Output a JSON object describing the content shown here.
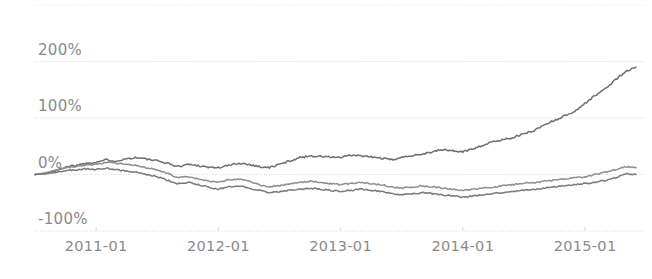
{
  "chart_data": {
    "type": "line",
    "title": "",
    "subtitle": "",
    "xlabel": "",
    "ylabel": "",
    "grid": true,
    "legend_position": "none",
    "xlim": [
      "2010-07",
      "2015-07"
    ],
    "ylim": [
      -100,
      300
    ],
    "ytick_labels": [
      "200%",
      "100%",
      "0%",
      "-100%"
    ],
    "ytick_values": [
      200,
      100,
      0,
      -100
    ],
    "xtick_labels": [
      "2011-01",
      "2012-01",
      "2013-01",
      "2014-01",
      "2015-01"
    ],
    "x": [
      "2010-07",
      "2010-08",
      "2010-09",
      "2010-10",
      "2010-11",
      "2010-12",
      "2011-01",
      "2011-02",
      "2011-03",
      "2011-04",
      "2011-05",
      "2011-06",
      "2011-07",
      "2011-08",
      "2011-09",
      "2011-10",
      "2011-11",
      "2011-12",
      "2012-01",
      "2012-02",
      "2012-03",
      "2012-04",
      "2012-05",
      "2012-06",
      "2012-07",
      "2012-08",
      "2012-09",
      "2012-10",
      "2012-11",
      "2012-12",
      "2013-01",
      "2013-02",
      "2013-03",
      "2013-04",
      "2013-05",
      "2013-06",
      "2013-07",
      "2013-08",
      "2013-09",
      "2013-10",
      "2013-11",
      "2013-12",
      "2014-01",
      "2014-02",
      "2014-03",
      "2014-04",
      "2014-05",
      "2014-06",
      "2014-07",
      "2014-08",
      "2014-09",
      "2014-10",
      "2014-11",
      "2014-12",
      "2015-01",
      "2015-02",
      "2015-03",
      "2015-04",
      "2015-05",
      "2015-06"
    ],
    "series": [
      {
        "name": "series-1",
        "color": "#6e6e6e",
        "values": [
          0,
          2,
          6,
          14,
          16,
          20,
          22,
          26,
          24,
          28,
          30,
          27,
          24,
          20,
          14,
          18,
          16,
          13,
          12,
          16,
          20,
          18,
          14,
          12,
          18,
          24,
          30,
          33,
          32,
          31,
          30,
          34,
          33,
          31,
          29,
          26,
          30,
          34,
          36,
          40,
          44,
          42,
          40,
          46,
          52,
          58,
          62,
          66,
          72,
          78,
          88,
          96,
          104,
          112,
          126,
          140,
          152,
          168,
          182,
          190
        ]
      },
      {
        "name": "series-2",
        "color": "#8f8f8f",
        "values": [
          0,
          3,
          8,
          12,
          14,
          17,
          18,
          22,
          20,
          18,
          16,
          12,
          8,
          2,
          -6,
          -4,
          -8,
          -12,
          -14,
          -10,
          -8,
          -12,
          -18,
          -22,
          -20,
          -16,
          -14,
          -12,
          -14,
          -16,
          -18,
          -16,
          -14,
          -16,
          -18,
          -22,
          -24,
          -22,
          -20,
          -22,
          -24,
          -26,
          -28,
          -26,
          -24,
          -22,
          -20,
          -18,
          -16,
          -14,
          -12,
          -10,
          -8,
          -6,
          -4,
          0,
          4,
          8,
          14,
          12
        ]
      },
      {
        "name": "series-3",
        "color": "#7a7a7a",
        "values": [
          0,
          1,
          4,
          7,
          8,
          10,
          9,
          11,
          8,
          6,
          4,
          0,
          -4,
          -10,
          -16,
          -14,
          -18,
          -22,
          -26,
          -22,
          -20,
          -24,
          -28,
          -32,
          -30,
          -28,
          -26,
          -24,
          -26,
          -28,
          -30,
          -28,
          -26,
          -28,
          -30,
          -34,
          -36,
          -34,
          -32,
          -34,
          -36,
          -38,
          -40,
          -38,
          -36,
          -34,
          -32,
          -30,
          -28,
          -26,
          -24,
          -22,
          -20,
          -18,
          -16,
          -14,
          -10,
          -6,
          2,
          0
        ]
      }
    ]
  },
  "axis": {
    "tick_color": "#8a8a8a",
    "grid_color": "#d9d9d9"
  }
}
